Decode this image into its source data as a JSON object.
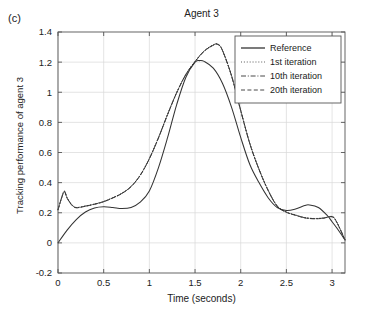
{
  "panel_label": "(c)",
  "axis_labels": {
    "x": "Time (seconds)",
    "y": "Tracking performance of agent 3"
  },
  "chart_data": {
    "type": "line",
    "title": "Agent 3",
    "xlabel": "Time (seconds)",
    "ylabel": "Tracking performance of agent 3",
    "xlim": [
      0,
      3.1416
    ],
    "ylim": [
      -0.2,
      1.4
    ],
    "xticks": [
      0,
      0.5,
      1,
      1.5,
      2,
      2.5,
      3
    ],
    "xtick_labels": [
      "0",
      "0.5",
      "1",
      "1.5",
      "2",
      "2.5",
      "3"
    ],
    "yticks": [
      -0.2,
      0,
      0.2,
      0.4,
      0.6,
      0.8,
      1,
      1.2,
      1.4
    ],
    "ytick_labels": [
      "-0.2",
      "0",
      "0.2",
      "0.4",
      "0.6",
      "0.8",
      "1",
      "1.2",
      "1.4"
    ],
    "grid": true,
    "legend_position": "upper right",
    "colors": {
      "line": "#333333",
      "grid": "#d8d8d8",
      "axis": "#555555"
    },
    "series": [
      {
        "name": "Reference",
        "style": "solid",
        "x": [
          0,
          0.1,
          0.2,
          0.3,
          0.4,
          0.5,
          0.6,
          0.7,
          0.8,
          0.9,
          1.0,
          1.1,
          1.2,
          1.3,
          1.4,
          1.5,
          1.55,
          1.6,
          1.7,
          1.8,
          1.9,
          2.0,
          2.1,
          2.2,
          2.3,
          2.4,
          2.5,
          2.6,
          2.7,
          2.75,
          2.85,
          2.95,
          3.0,
          3.05,
          3.1416
        ],
        "y": [
          0.0,
          0.085,
          0.155,
          0.205,
          0.232,
          0.24,
          0.235,
          0.228,
          0.235,
          0.27,
          0.345,
          0.5,
          0.7,
          0.92,
          1.1,
          1.2,
          1.21,
          1.205,
          1.16,
          1.06,
          0.9,
          0.7,
          0.52,
          0.4,
          0.3,
          0.235,
          0.215,
          0.225,
          0.248,
          0.252,
          0.235,
          0.18,
          0.14,
          0.1,
          0.02
        ]
      },
      {
        "name": "1st iteration",
        "style": "dotted",
        "x": [
          0,
          0.04,
          0.07,
          0.1,
          0.15,
          0.2,
          0.3,
          0.4,
          0.5,
          0.6,
          0.7,
          0.8,
          0.9,
          1.0,
          1.1,
          1.2,
          1.3,
          1.4,
          1.5,
          1.6,
          1.7,
          1.75,
          1.8,
          1.9,
          2.0,
          2.1,
          2.2,
          2.3,
          2.4,
          2.5,
          2.6,
          2.7,
          2.8,
          2.9,
          3.0,
          3.05,
          3.1416
        ],
        "y": [
          0.22,
          0.3,
          0.345,
          0.3,
          0.255,
          0.235,
          0.245,
          0.258,
          0.275,
          0.3,
          0.33,
          0.375,
          0.45,
          0.56,
          0.7,
          0.855,
          1.0,
          1.12,
          1.205,
          1.275,
          1.315,
          1.32,
          1.28,
          1.11,
          0.88,
          0.66,
          0.49,
          0.35,
          0.245,
          0.205,
          0.185,
          0.168,
          0.162,
          0.165,
          0.175,
          0.14,
          0.02
        ]
      },
      {
        "name": "10th iteration",
        "style": "dashdot",
        "x": [
          0,
          0.04,
          0.07,
          0.1,
          0.15,
          0.2,
          0.3,
          0.4,
          0.5,
          0.6,
          0.7,
          0.8,
          0.9,
          1.0,
          1.1,
          1.2,
          1.3,
          1.4,
          1.5,
          1.6,
          1.7,
          1.75,
          1.8,
          1.9,
          2.0,
          2.1,
          2.2,
          2.3,
          2.4,
          2.5,
          2.6,
          2.7,
          2.8,
          2.9,
          3.0,
          3.05,
          3.1416
        ],
        "y": [
          0.22,
          0.3,
          0.342,
          0.298,
          0.253,
          0.234,
          0.244,
          0.257,
          0.274,
          0.299,
          0.329,
          0.374,
          0.449,
          0.559,
          0.698,
          0.853,
          0.998,
          1.118,
          1.203,
          1.273,
          1.313,
          1.318,
          1.278,
          1.108,
          0.879,
          0.659,
          0.489,
          0.349,
          0.244,
          0.204,
          0.184,
          0.167,
          0.161,
          0.164,
          0.174,
          0.139,
          0.02
        ]
      },
      {
        "name": "20th iteration",
        "style": "dashed",
        "x": [
          0,
          0.04,
          0.07,
          0.1,
          0.15,
          0.2,
          0.3,
          0.4,
          0.5,
          0.6,
          0.7,
          0.8,
          0.9,
          1.0,
          1.1,
          1.2,
          1.3,
          1.4,
          1.5,
          1.6,
          1.7,
          1.75,
          1.8,
          1.9,
          2.0,
          2.1,
          2.2,
          2.3,
          2.4,
          2.5,
          2.6,
          2.7,
          2.8,
          2.9,
          3.0,
          3.05,
          3.1416
        ],
        "y": [
          0.22,
          0.299,
          0.34,
          0.296,
          0.251,
          0.233,
          0.243,
          0.256,
          0.273,
          0.298,
          0.328,
          0.373,
          0.448,
          0.558,
          0.697,
          0.852,
          0.997,
          1.117,
          1.202,
          1.272,
          1.312,
          1.317,
          1.277,
          1.107,
          0.878,
          0.658,
          0.488,
          0.348,
          0.243,
          0.203,
          0.183,
          0.166,
          0.16,
          0.163,
          0.173,
          0.138,
          0.02
        ]
      }
    ],
    "legend": [
      {
        "label": "Reference",
        "style": "solid"
      },
      {
        "label": "1st iteration",
        "style": "dotted"
      },
      {
        "label": "10th iteration",
        "style": "dashdot"
      },
      {
        "label": "20th iteration",
        "style": "dashed"
      }
    ]
  }
}
